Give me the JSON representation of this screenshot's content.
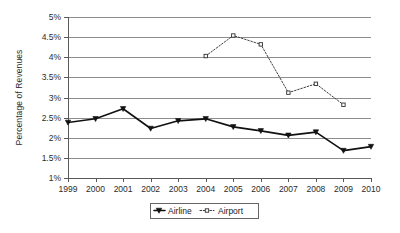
{
  "chart_data": {
    "type": "line",
    "title": "",
    "xlabel": "",
    "ylabel": "Percentage of Revenues",
    "categories": [
      "1999",
      "2000",
      "2001",
      "2002",
      "2003",
      "2004",
      "2005",
      "2006",
      "2007",
      "2008",
      "2009",
      "2010"
    ],
    "ylim": [
      1,
      5
    ],
    "ytick_labels": [
      "5%",
      "4.5%",
      "4%",
      "3.5%",
      "3%",
      "2.5%",
      "2%",
      "1.5%",
      "1%"
    ],
    "ytick_values": [
      5,
      4.5,
      4,
      3.5,
      3,
      2.5,
      2,
      1.5,
      1
    ],
    "grid": true,
    "legend_position": "bottom",
    "series": [
      {
        "name": "Airline",
        "marker": "filled-triangle-down",
        "line_style": "solid",
        "color": "#111111",
        "values": [
          2.38,
          2.47,
          2.72,
          2.23,
          2.42,
          2.47,
          2.27,
          2.17,
          2.06,
          2.14,
          1.68,
          1.78
        ]
      },
      {
        "name": "Airport",
        "marker": "open-square",
        "line_style": "dotted",
        "color": "#3d3d3d",
        "values": [
          null,
          null,
          null,
          null,
          null,
          4.03,
          4.54,
          4.32,
          3.12,
          3.34,
          2.82,
          null
        ]
      }
    ]
  },
  "legend": {
    "items": [
      {
        "label": "Airline"
      },
      {
        "label": "Airport"
      }
    ]
  }
}
